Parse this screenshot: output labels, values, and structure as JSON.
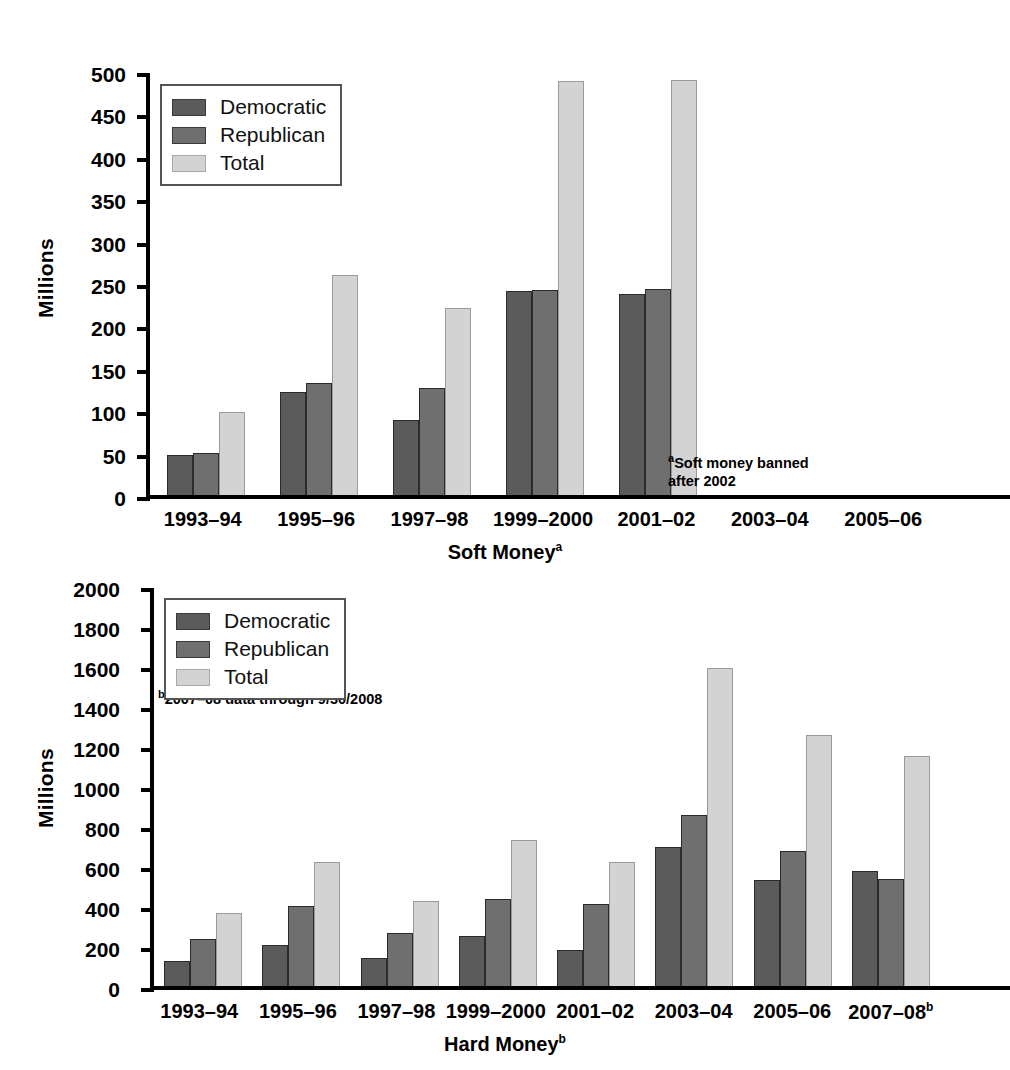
{
  "colors": {
    "democratic": "#5b5b5b",
    "republican": "#6f6f6f",
    "total": "#d3d3d3",
    "axis": "#000000",
    "background": "#ffffff"
  },
  "legend": {
    "democratic": "Democratic",
    "republican": "Republican",
    "total": "Total"
  },
  "top": {
    "ylabel": "Millions",
    "xtitle": "Soft Money",
    "xtitle_sup": "a",
    "note_line1": "Soft money banned",
    "note_line2": "after 2002",
    "note_sup": "a",
    "ticks": [
      "500",
      "450",
      "400",
      "350",
      "300",
      "250",
      "200",
      "150",
      "100",
      "50",
      "0"
    ],
    "categories": [
      "1993–94",
      "1995–96",
      "1997–98",
      "1999–2000",
      "2001–02",
      "2003–04",
      "2005–06"
    ]
  },
  "bottom": {
    "ylabel": "Millions",
    "xtitle": "Hard Money",
    "xtitle_sup": "b",
    "note": "2007–08 data through 9/30/2008",
    "note_sup": "b",
    "ticks": [
      "2000",
      "1800",
      "1600",
      "1400",
      "1200",
      "1000",
      "800",
      "600",
      "400",
      "200",
      "0"
    ],
    "categories": [
      "1993–94",
      "1995–96",
      "1997–98",
      "1999–2000",
      "2001–02",
      "2003–04",
      "2005–06",
      "2007–08"
    ],
    "last_category_sup": "b"
  },
  "chart_data": [
    {
      "type": "bar",
      "title": "Soft Money",
      "xlabel": "Soft Money (a)",
      "ylabel": "Millions",
      "ylim": [
        0,
        500
      ],
      "ytick_step": 50,
      "grid": false,
      "legend_position": "top-left",
      "annotations": [
        "aSoft money banned after 2002"
      ],
      "categories": [
        "1993–94",
        "1995–96",
        "1997–98",
        "1999–2000",
        "2001–02",
        "2003–04",
        "2005–06"
      ],
      "series": [
        {
          "name": "Democratic",
          "color": "#5b5b5b",
          "values": [
            47,
            122,
            89,
            240,
            237,
            null,
            null
          ]
        },
        {
          "name": "Republican",
          "color": "#6f6f6f",
          "values": [
            50,
            132,
            126,
            242,
            243,
            null,
            null
          ]
        },
        {
          "name": "Total",
          "color": "#d3d3d3",
          "values": [
            98,
            259,
            220,
            488,
            489,
            null,
            null
          ]
        }
      ]
    },
    {
      "type": "bar",
      "title": "Hard Money",
      "xlabel": "Hard Money (b)",
      "ylabel": "Millions",
      "ylim": [
        0,
        2000
      ],
      "ytick_step": 200,
      "grid": false,
      "legend_position": "top-left",
      "annotations": [
        "b2007–08 data through 9/30/2008"
      ],
      "categories": [
        "1993–94",
        "1995–96",
        "1997–98",
        "1999–2000",
        "2001–02",
        "2003–04",
        "2005–06",
        "2007–08"
      ],
      "series": [
        {
          "name": "Democratic",
          "color": "#5b5b5b",
          "values": [
            125,
            205,
            140,
            250,
            180,
            695,
            530,
            575
          ]
        },
        {
          "name": "Republican",
          "color": "#6f6f6f",
          "values": [
            235,
            400,
            265,
            435,
            410,
            855,
            675,
            535
          ]
        },
        {
          "name": "Total",
          "color": "#d3d3d3",
          "values": [
            365,
            620,
            425,
            730,
            620,
            1590,
            1255,
            1150
          ]
        }
      ]
    }
  ]
}
